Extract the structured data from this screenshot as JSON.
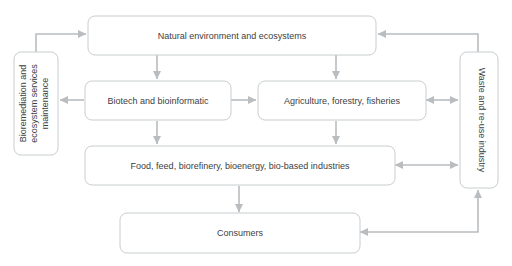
{
  "diagram": {
    "background_color": "#ffffff",
    "node_fill": "#ffffff",
    "node_stroke": "#c8cdd0",
    "edge_color": "#b9bdc0",
    "text_color": "#3c4043",
    "nodes": [
      {
        "id": "natural-environment",
        "label": "Natural environment and ecosystems",
        "orientation": "horizontal"
      },
      {
        "id": "bioremediation",
        "label": "Bioremediation and ecosystem services maintenance",
        "line1": "Bioremediation and",
        "line2": "ecosystem services",
        "line3": "maintenance",
        "orientation": "vertical-up"
      },
      {
        "id": "waste-industry",
        "label": "Waste and re-use industry",
        "orientation": "vertical-down"
      },
      {
        "id": "biotech",
        "label": "Biotech and bioinformatic",
        "orientation": "horizontal"
      },
      {
        "id": "agriculture",
        "label": "Agriculture, forestry, fisheries",
        "orientation": "horizontal"
      },
      {
        "id": "food-industries",
        "label": "Food, feed, biorefinery, bioenergy, bio-based industries",
        "orientation": "horizontal"
      },
      {
        "id": "consumers",
        "label": "Consumers",
        "orientation": "horizontal"
      }
    ],
    "edges": [
      {
        "id": "bioremediation-to-natural",
        "from": "bioremediation",
        "to": "natural-environment",
        "arrows": "single"
      },
      {
        "id": "waste-to-natural",
        "from": "waste-industry",
        "to": "natural-environment",
        "arrows": "single"
      },
      {
        "id": "natural-to-biotech",
        "from": "natural-environment",
        "to": "biotech",
        "arrows": "single"
      },
      {
        "id": "natural-to-agriculture",
        "from": "natural-environment",
        "to": "agriculture",
        "arrows": "single"
      },
      {
        "id": "biotech-to-bioremediation",
        "from": "biotech",
        "to": "bioremediation",
        "arrows": "single"
      },
      {
        "id": "biotech-to-agriculture",
        "from": "biotech",
        "to": "agriculture",
        "arrows": "single"
      },
      {
        "id": "agriculture-waste",
        "from": "agriculture",
        "to": "waste-industry",
        "arrows": "double"
      },
      {
        "id": "biotech-to-food",
        "from": "biotech",
        "to": "food-industries",
        "arrows": "single"
      },
      {
        "id": "agriculture-to-food",
        "from": "agriculture",
        "to": "food-industries",
        "arrows": "single"
      },
      {
        "id": "food-waste",
        "from": "food-industries",
        "to": "waste-industry",
        "arrows": "double"
      },
      {
        "id": "food-to-consumers",
        "from": "food-industries",
        "to": "consumers",
        "arrows": "single"
      },
      {
        "id": "consumers-waste",
        "from": "consumers",
        "to": "waste-industry",
        "arrows": "double-corner"
      }
    ]
  }
}
